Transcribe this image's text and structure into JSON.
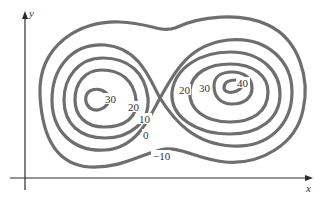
{
  "figure": {
    "type": "contour-map",
    "axes": {
      "x_label": "x",
      "y_label": "y"
    },
    "contour_labels": [
      {
        "id": "left-30",
        "text": "30"
      },
      {
        "id": "left-20",
        "text": "20"
      },
      {
        "id": "left-10",
        "text": "10"
      },
      {
        "id": "zero",
        "text": "0"
      },
      {
        "id": "neg10",
        "text": "−10"
      },
      {
        "id": "right-20",
        "text": "20"
      },
      {
        "id": "right-30",
        "text": "30"
      },
      {
        "id": "right-40",
        "text": "40"
      }
    ],
    "levels": [
      -10,
      0,
      10,
      20,
      30,
      40
    ],
    "colors": {
      "contour": "#6e6e6e",
      "axis": "#2a2a2a",
      "text": "#333333"
    }
  }
}
